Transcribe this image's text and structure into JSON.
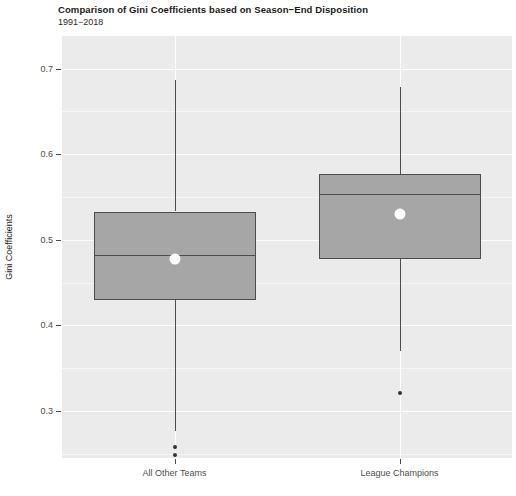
{
  "chart_data": {
    "type": "box",
    "title": "Comparison of Gini Coefficients based on Season−End Disposition",
    "subtitle": "1991−2018",
    "xlabel": "",
    "ylabel": "Gini Coefficients",
    "ylim": [
      0.245,
      0.738
    ],
    "yticks": [
      0.3,
      0.4,
      0.5,
      0.6,
      0.7
    ],
    "ytick_labels": [
      "0.3",
      "0.4",
      "0.5",
      "0.6",
      "0.7"
    ],
    "grid": true,
    "legend": "none",
    "categories": [
      "All Other Teams",
      "League Champions"
    ],
    "box_fill": "#a6a6a6",
    "box_stroke": "#4d4d4d",
    "mean_marker_color": "#ffffff",
    "panel_background": "#ebebeb",
    "boxes": [
      {
        "category": "All Other Teams",
        "whisker_low": 0.277,
        "q1": 0.43,
        "median": 0.482,
        "q3": 0.533,
        "whisker_high": 0.687,
        "mean": 0.478,
        "outliers": [
          0.258,
          0.249
        ]
      },
      {
        "category": "League Champions",
        "whisker_low": 0.37,
        "q1": 0.477,
        "median": 0.554,
        "q3": 0.577,
        "whisker_high": 0.678,
        "mean": 0.53,
        "outliers": [
          0.321
        ]
      }
    ]
  }
}
